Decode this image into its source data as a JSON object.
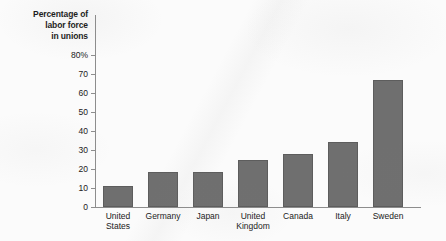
{
  "chart_data": {
    "type": "bar",
    "title": "",
    "ylabel": "Percentage of labor force in unions",
    "ylabel_lines": [
      "Percentage of",
      "labor force",
      "in unions"
    ],
    "xlabel": "",
    "categories": [
      "United States",
      "Germany",
      "Japan",
      "United Kingdom",
      "Canada",
      "Italy",
      "Sweden"
    ],
    "category_lines": [
      [
        "United",
        "States"
      ],
      [
        "Germany"
      ],
      [
        "Japan"
      ],
      [
        "United",
        "Kingdom"
      ],
      [
        "Canada"
      ],
      [
        "Italy"
      ],
      [
        "Sweden"
      ]
    ],
    "values": [
      11,
      18.5,
      18.5,
      25,
      28,
      34,
      67
    ],
    "ylim": [
      0,
      80
    ],
    "ytick_labels": [
      "80%",
      "70",
      "60",
      "50",
      "40",
      "30",
      "20",
      "10",
      "0"
    ],
    "ytick_values": [
      80,
      70,
      60,
      50,
      40,
      30,
      20,
      10,
      0
    ],
    "grid": false,
    "legend": false,
    "bar_color": "#6f6f6f",
    "axis_color": "#8d8d8d",
    "background_color": "#fbfbfb"
  }
}
